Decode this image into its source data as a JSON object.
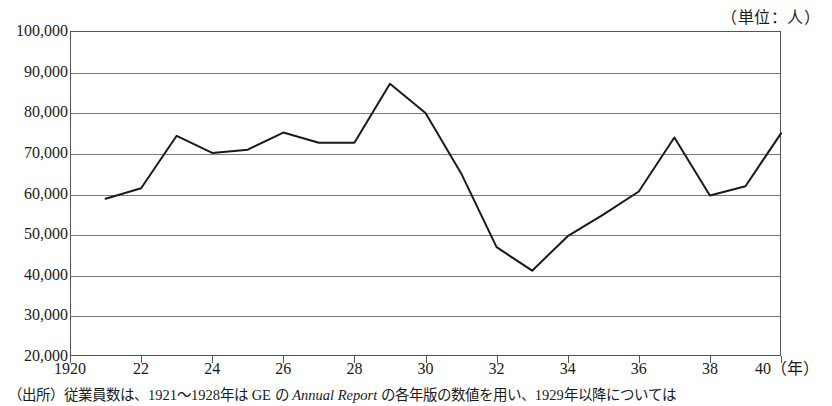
{
  "unit_caption": "（単位：人）",
  "source_note": {
    "prefix": "（出所）",
    "text_before_italic": "従業員数は、1921～1928年は GE の ",
    "italic_title": "Annual Report",
    "text_after_italic": " の各年版の数値を用い、1929年以降については"
  },
  "chart_data": {
    "type": "line",
    "title": "",
    "subtitle": "",
    "xlabel": "（年）",
    "ylabel": "",
    "unit": "人",
    "grid": true,
    "legend": "none",
    "xlim": [
      1920,
      1940
    ],
    "ylim": [
      20000,
      100000
    ],
    "ytick_labels": [
      "100,000",
      "90,000",
      "80,000",
      "70,000",
      "60,000",
      "50,000",
      "40,000",
      "30,000",
      "20,000"
    ],
    "ytick_values": [
      100000,
      90000,
      80000,
      70000,
      60000,
      50000,
      40000,
      30000,
      20000
    ],
    "xtick_labels": [
      "1920",
      "22",
      "24",
      "26",
      "28",
      "30",
      "32",
      "34",
      "36",
      "38",
      "40"
    ],
    "xtick_values": [
      1920,
      1922,
      1924,
      1926,
      1928,
      1930,
      1932,
      1934,
      1936,
      1938,
      1940
    ],
    "xaxis_suffix": "（年）",
    "series": [
      {
        "name": "従業員数",
        "color": "#1a1a1a",
        "x": [
          1921,
          1922,
          1923,
          1924,
          1925,
          1926,
          1927,
          1928,
          1929,
          1930,
          1931,
          1932,
          1933,
          1934,
          1935,
          1936,
          1937,
          1938,
          1939,
          1940
        ],
        "values": [
          58700,
          61300,
          74200,
          70000,
          70800,
          75000,
          72500,
          72500,
          87000,
          79800,
          65000,
          46800,
          41000,
          49500,
          54800,
          60500,
          73800,
          59500,
          61800,
          74800
        ]
      }
    ]
  }
}
